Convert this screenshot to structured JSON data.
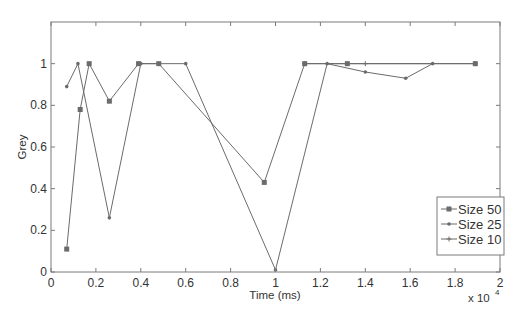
{
  "chart_data": {
    "type": "line",
    "title": "",
    "xlabel": "Time (ms)",
    "ylabel": "Grey",
    "x_multiplier_label": "x 10",
    "x_multiplier_exp": "4",
    "xlim": [
      0,
      2
    ],
    "ylim": [
      0,
      1.2
    ],
    "xticks": [
      0,
      0.2,
      0.4,
      0.6,
      0.8,
      1,
      1.2,
      1.4,
      1.6,
      1.8,
      2
    ],
    "xtick_labels": [
      "0",
      "0.2",
      "0.4",
      "0.6",
      "0.8",
      "1",
      "1.2",
      "1.4",
      "1.6",
      "1.8",
      "2"
    ],
    "yticks": [
      0,
      0.2,
      0.4,
      0.6,
      0.8,
      1
    ],
    "ytick_labels": [
      "0",
      "0.2",
      "0.4",
      "0.6",
      "0.8",
      "1"
    ],
    "grid": false,
    "legend_position": "lower right",
    "series": [
      {
        "name": "Size 50",
        "marker": "square",
        "x": [
          0.07,
          0.13,
          0.17,
          0.26,
          0.39,
          0.48,
          0.95,
          1.13,
          1.32,
          1.89
        ],
        "y": [
          0.11,
          0.78,
          1.0,
          0.82,
          1.0,
          1.0,
          0.43,
          1.0,
          1.0,
          1.0
        ]
      },
      {
        "name": "Size 25",
        "marker": "dot",
        "x": [
          0.07,
          0.12,
          0.26,
          0.4,
          0.6,
          1.0,
          1.23,
          1.4,
          1.58,
          1.7
        ],
        "y": [
          0.89,
          1.0,
          0.26,
          1.0,
          1.0,
          0.01,
          1.0,
          0.96,
          0.93,
          1.0
        ]
      },
      {
        "name": "Size 10",
        "marker": "plus",
        "x": [
          1.13,
          1.4,
          1.89
        ],
        "y": [
          1.0,
          1.0,
          1.0
        ]
      }
    ],
    "colors": {
      "line": "#6b6b6b",
      "axis": "#7a7a7a",
      "text": "#333333"
    }
  }
}
